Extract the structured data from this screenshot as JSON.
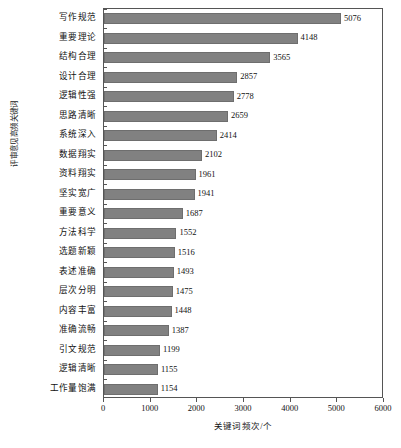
{
  "chart_data": {
    "type": "bar",
    "orientation": "horizontal",
    "title": "",
    "xlabel": "关键词频次/个",
    "ylabel": "评审意见高频关键词",
    "xlim": [
      0,
      6000
    ],
    "xticks": [
      0,
      1000,
      2000,
      3000,
      4000,
      5000,
      6000
    ],
    "grid": false,
    "legend": null,
    "bar_color": "#818181",
    "categories": [
      "写作规范",
      "重要理论",
      "结构合理",
      "设计合理",
      "逻辑性强",
      "思路清晰",
      "系统深入",
      "数据翔实",
      "资料翔实",
      "坚实宽广",
      "重要意义",
      "方法科学",
      "选题新颖",
      "表述准确",
      "层次分明",
      "内容丰富",
      "准确流畅",
      "引文规范",
      "逻辑清晰",
      "工作量饱满"
    ],
    "values": [
      5076,
      4148,
      3565,
      2857,
      2778,
      2659,
      2414,
      2102,
      1961,
      1941,
      1687,
      1552,
      1516,
      1493,
      1475,
      1448,
      1387,
      1199,
      1155,
      1154
    ],
    "value_labels": [
      "5076",
      "4148",
      "3565",
      "2857",
      "2778",
      "2659",
      "2414",
      "2102",
      "1961",
      "1941",
      "1687",
      "1552",
      "1516",
      "1493",
      "1475",
      "1448",
      "1387",
      "1199",
      "1155",
      "1154"
    ],
    "xtick_labels": [
      "0",
      "1000",
      "2000",
      "3000",
      "4000",
      "5000",
      "6000"
    ]
  }
}
